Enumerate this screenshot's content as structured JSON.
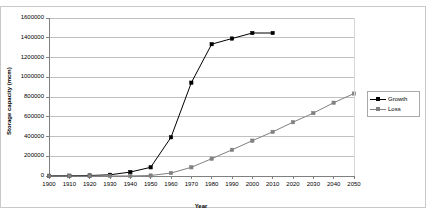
{
  "chart_data": {
    "type": "line",
    "title": "",
    "xlabel": "Year",
    "ylabel": "Storage capacity (mcm)",
    "xlim": [
      1900,
      2050
    ],
    "ylim": [
      0,
      1600000
    ],
    "ytick_step": 200000,
    "xtick_step": 10,
    "grid": "horizontal",
    "legend_position": "right",
    "x": [
      1900,
      1910,
      1920,
      1930,
      1940,
      1950,
      1960,
      1970,
      1980,
      1990,
      2000,
      2010,
      2020,
      2030,
      2040,
      2050
    ],
    "xticklabels": [
      "1900",
      "1910",
      "1920",
      "1930",
      "1940",
      "1950",
      "1960",
      "1970",
      "1980",
      "1990",
      "2000",
      "2010",
      "2020",
      "2030",
      "2040",
      "2050"
    ],
    "yticklabels": [
      "0",
      "200000",
      "400000",
      "600000",
      "800000",
      "1000000",
      "1200000",
      "1400000",
      "1600000"
    ],
    "yticks": [
      0,
      200000,
      400000,
      600000,
      800000,
      1000000,
      1200000,
      1400000,
      1600000
    ],
    "series": [
      {
        "name": "Growth",
        "color": "#000000",
        "marker": "square",
        "x": [
          1900,
          1910,
          1920,
          1930,
          1940,
          1950,
          1960,
          1970,
          1980,
          1990,
          2000,
          2010
        ],
        "values": [
          2000,
          3000,
          5000,
          12000,
          40000,
          88000,
          392000,
          945000,
          1335000,
          1392000,
          1448000,
          1448000
        ]
      },
      {
        "name": "Loss",
        "color": "#808080",
        "marker": "square",
        "x": [
          1900,
          1910,
          1920,
          1930,
          1940,
          1950,
          1960,
          1970,
          1980,
          1990,
          2000,
          2010,
          2020,
          2030,
          2040,
          2050
        ],
        "values": [
          0,
          0,
          0,
          0,
          1000,
          5000,
          30000,
          88000,
          175000,
          265000,
          358000,
          447000,
          545000,
          637000,
          742000,
          835000
        ]
      }
    ]
  },
  "legend": {
    "items": [
      {
        "label": "Growth"
      },
      {
        "label": "Loss"
      }
    ]
  }
}
